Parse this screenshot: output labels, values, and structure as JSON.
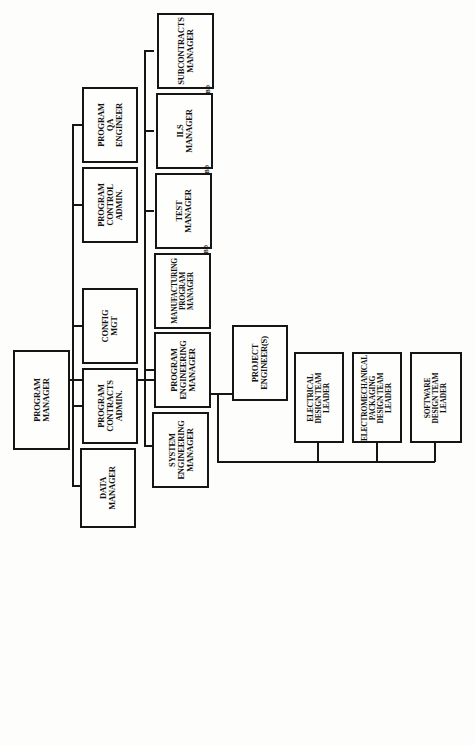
{
  "diagram": {
    "type": "org-chart",
    "orientation": "rotated-90-ccw",
    "root": {
      "label": "PROGRAM\nMANAGER"
    },
    "staff": [
      {
        "label": "PROGRAM\nQA\nENGINEER"
      },
      {
        "label": "PROGRAM\nCONTROL\nADMIN."
      },
      {
        "label": "CONFIG\nMGT"
      },
      {
        "label": "PROGRAM\nCONTRACTS\nADMIN."
      },
      {
        "label": "DATA\nMANAGER"
      }
    ],
    "line_managers": [
      {
        "label": "SUBCONTRACTS\nMANAGER",
        "tag": "TBD"
      },
      {
        "label": "ILS\nMANAGER",
        "tag": "TBD"
      },
      {
        "label": "TEST\nMANAGER",
        "tag": "TBD"
      },
      {
        "label": "MANUFACTURING\nPROGRAM\nMANAGER"
      },
      {
        "label": "PROGRAM\nENGINEERING\nMANAGER"
      },
      {
        "label": "SYSTEM\nENGINEERING\nMANAGER"
      }
    ],
    "engineering": {
      "project_engineers": {
        "label": "PROJECT\nENGINEER(S)"
      },
      "team_leaders": [
        {
          "label": "ELECTRICAL\nDESIGN TEAM\nLEADER"
        },
        {
          "label": "ELECTROMECHANICAL\nPACKAGING\nDESIGN TEAM\nLEADER"
        },
        {
          "label": "SOFTWARE\nDESIGN TEAM\nLEADER"
        }
      ]
    },
    "colors": {
      "line": "#151515",
      "background": "#fdfdfb"
    }
  }
}
